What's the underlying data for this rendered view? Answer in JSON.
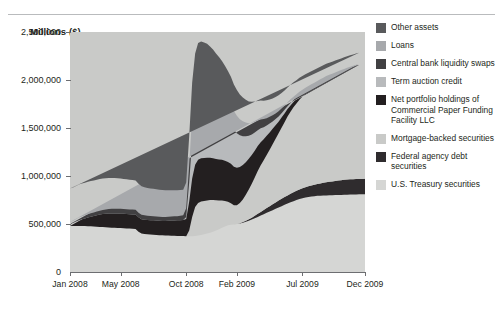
{
  "axis_title": "Millions ($)",
  "legend": {
    "items": [
      {
        "label": "Other assets",
        "color": "#595a5c"
      },
      {
        "label": "Loans",
        "color": "#a7a9ac"
      },
      {
        "label": "Central bank liquidity swaps",
        "color": "#414042"
      },
      {
        "label": "Term auction credit",
        "color": "#b8babc"
      },
      {
        "label": "Net portfolio holdings of Commercial Paper Funding Facility LLC",
        "color": "#231f20"
      },
      {
        "label": "Mortgage-backed securities",
        "color": "#c9cac8"
      },
      {
        "label": "Federal agency debt securities",
        "color": "#2f2c2e"
      },
      {
        "label": "U.S. Treasury securities",
        "color": "#d5d6d4"
      }
    ]
  },
  "chart_data": {
    "type": "area",
    "title": "",
    "xlabel": "",
    "ylabel": "Millions ($)",
    "ylim": [
      0,
      2500000
    ],
    "ytick_labels": [
      "0",
      "500,000",
      "1,000,000",
      "1,500,000",
      "2,000,000",
      "2,500,000"
    ],
    "ytick_values": [
      0,
      500000,
      1000000,
      1500000,
      2000000,
      2500000
    ],
    "grid": false,
    "legend_position": "right",
    "stacked": true,
    "xtick_labels": [
      "Jan 2008",
      "May 2008",
      "Oct 2008",
      "Feb 2009",
      "Jul 2009",
      "Dec 2009"
    ],
    "xtick_index": [
      0,
      17,
      39,
      56,
      78,
      99
    ],
    "x_count": 100,
    "series": [
      {
        "name": "U.S. Treasury securities",
        "color": "#d5d6d4",
        "values": [
          480000,
          480000,
          480000,
          480000,
          479000,
          478000,
          477000,
          476000,
          474000,
          472000,
          470000,
          468000,
          466000,
          464000,
          462000,
          460000,
          459000,
          458000,
          456000,
          454000,
          452000,
          450000,
          448000,
          420000,
          400000,
          395000,
          392000,
          390000,
          388000,
          386000,
          384000,
          382000,
          380000,
          379000,
          378000,
          377000,
          376000,
          375000,
          374000,
          373000,
          372000,
          373000,
          376000,
          380000,
          385000,
          392000,
          400000,
          410000,
          420000,
          432000,
          445000,
          460000,
          474000,
          486000,
          492000,
          496000,
          500000,
          506000,
          514000,
          524000,
          534000,
          546000,
          560000,
          574000,
          588000,
          602000,
          616000,
          630000,
          644000,
          658000,
          672000,
          686000,
          700000,
          714000,
          726000,
          738000,
          750000,
          760000,
          768000,
          775000,
          781000,
          786000,
          790000,
          793000,
          795000,
          797000,
          798000,
          799000,
          800000,
          801000,
          802000,
          803000,
          804000,
          805000,
          806000,
          807000,
          808000,
          809000,
          810000,
          811000
        ]
      },
      {
        "name": "Federal agency debt securities",
        "color": "#2f2c2e",
        "values": [
          0,
          0,
          0,
          0,
          0,
          0,
          0,
          0,
          0,
          0,
          0,
          0,
          0,
          0,
          0,
          0,
          0,
          0,
          0,
          0,
          0,
          0,
          0,
          0,
          0,
          0,
          0,
          0,
          0,
          0,
          0,
          0,
          0,
          0,
          0,
          0,
          0,
          0,
          0,
          0,
          0,
          0,
          0,
          0,
          0,
          0,
          0,
          0,
          0,
          0,
          0,
          0,
          0,
          0,
          0,
          0,
          1000,
          3000,
          6000,
          10000,
          15000,
          20000,
          26000,
          32000,
          38000,
          44000,
          50000,
          56000,
          62000,
          67000,
          72000,
          76000,
          80000,
          84000,
          88000,
          92000,
          96000,
          100000,
          104000,
          108000,
          112000,
          116000,
          120000,
          124000,
          128000,
          132000,
          136000,
          140000,
          144000,
          148000,
          151000,
          154000,
          157000,
          159000,
          160000,
          160000,
          160000,
          160000,
          160000,
          160000
        ]
      },
      {
        "name": "Mortgage-backed securities",
        "color": "#c9cac8",
        "values": [
          0,
          0,
          0,
          0,
          0,
          0,
          0,
          0,
          0,
          0,
          0,
          0,
          0,
          0,
          0,
          0,
          0,
          0,
          0,
          0,
          0,
          0,
          0,
          0,
          0,
          0,
          0,
          0,
          0,
          0,
          0,
          0,
          0,
          0,
          0,
          0,
          0,
          0,
          0,
          0,
          0,
          0,
          0,
          0,
          0,
          0,
          0,
          0,
          0,
          0,
          0,
          0,
          0,
          0,
          0,
          0,
          20000,
          60000,
          110000,
          170000,
          230000,
          290000,
          350000,
          410000,
          460000,
          500000,
          540000,
          580000,
          620000,
          660000,
          700000,
          740000,
          780000,
          820000,
          855000,
          885000,
          910000,
          935000,
          955000,
          975000,
          990000,
          1005000,
          1020000,
          1035000,
          1050000,
          1065000,
          1080000,
          1090000,
          1100000,
          1110000,
          1120000,
          1130000,
          1140000,
          1150000,
          1160000,
          1170000,
          1180000,
          1190000,
          1200000,
          1205000
        ]
      },
      {
        "name": "Net portfolio holdings of Commercial Paper Funding Facility LLC",
        "color": "#231f20",
        "values": [
          0,
          0,
          0,
          0,
          0,
          0,
          0,
          0,
          0,
          0,
          0,
          0,
          0,
          0,
          0,
          0,
          0,
          0,
          0,
          0,
          0,
          0,
          0,
          0,
          0,
          0,
          0,
          0,
          0,
          0,
          0,
          0,
          0,
          0,
          0,
          0,
          0,
          0,
          0,
          0,
          60000,
          200000,
          300000,
          340000,
          350000,
          348000,
          345000,
          340000,
          330000,
          315000,
          300000,
          285000,
          265000,
          245000,
          225000,
          200000,
          175000,
          150000,
          125000,
          100000,
          80000,
          62000,
          48000,
          36000,
          26000,
          18000,
          12000,
          8000,
          5000,
          3000,
          2000,
          1500,
          1000,
          800,
          600,
          500,
          400,
          300,
          250,
          200,
          160,
          130,
          100,
          80,
          60,
          50,
          40,
          30,
          25,
          20,
          15,
          12,
          10,
          8,
          6,
          5,
          4,
          3
        ]
      },
      {
        "name": "Term auction credit",
        "color": "#b8babc",
        "values": [
          20000,
          30000,
          45000,
          60000,
          70000,
          80000,
          90000,
          100000,
          110000,
          120000,
          128000,
          135000,
          140000,
          145000,
          148000,
          150000,
          150000,
          150000,
          150000,
          150000,
          150000,
          150000,
          150000,
          150000,
          150000,
          150000,
          150000,
          150000,
          150000,
          150000,
          150000,
          150000,
          152000,
          155000,
          158000,
          160000,
          162000,
          165000,
          168000,
          180000,
          300000,
          400000,
          440000,
          450000,
          450000,
          448000,
          445000,
          440000,
          435000,
          430000,
          428000,
          425000,
          420000,
          415000,
          410000,
          400000,
          390000,
          375000,
          360000,
          340000,
          320000,
          300000,
          280000,
          260000,
          240000,
          220000,
          200000,
          180000,
          160000,
          140000,
          120000,
          105000,
          90000,
          78000,
          66000,
          56000,
          48000,
          40000,
          34000,
          28000,
          24000,
          20000,
          17000,
          14000,
          12000,
          10000,
          8000,
          7000,
          6000,
          5000,
          4000,
          3500,
          3000,
          2500,
          2000,
          1600,
          1200,
          900,
          600,
          300
        ]
      },
      {
        "name": "Central bank liquidity swaps",
        "color": "#414042",
        "values": [
          0,
          0,
          0,
          0,
          0,
          0,
          0,
          0,
          0,
          0,
          0,
          0,
          0,
          0,
          0,
          0,
          0,
          0,
          0,
          0,
          0,
          0,
          0,
          0,
          0,
          0,
          0,
          0,
          0,
          0,
          0,
          0,
          0,
          0,
          0,
          0,
          0,
          0,
          0,
          20000,
          200000,
          400000,
          500000,
          540000,
          550000,
          545000,
          540000,
          530000,
          520000,
          505000,
          490000,
          470000,
          450000,
          430000,
          410000,
          385000,
          360000,
          330000,
          300000,
          270000,
          240000,
          215000,
          190000,
          165000,
          145000,
          125000,
          108000,
          92000,
          78000,
          66000,
          55000,
          46000,
          38000,
          31000,
          26000,
          21000,
          17000,
          14000,
          11000,
          9000,
          7000,
          5500,
          4500,
          3500,
          3000,
          2500,
          2000,
          1600,
          1300,
          1000,
          800,
          650,
          500,
          400,
          300,
          250,
          200,
          150,
          100
        ]
      },
      {
        "name": "Loans",
        "color": "#a7a9ac",
        "values": [
          20000,
          22000,
          25000,
          28000,
          30000,
          32000,
          34000,
          35000,
          36000,
          38000,
          40000,
          42000,
          44000,
          46000,
          48000,
          50000,
          50000,
          50000,
          50000,
          50000,
          50000,
          50000,
          50000,
          48000,
          46000,
          45000,
          44000,
          43000,
          42000,
          42000,
          42000,
          42000,
          42000,
          42000,
          42000,
          43000,
          44000,
          45000,
          48000,
          90000,
          180000,
          260000,
          300000,
          310000,
          305000,
          300000,
          295000,
          285000,
          275000,
          265000,
          255000,
          245000,
          235000,
          222000,
          210000,
          195000,
          182000,
          168000,
          155000,
          142000,
          130000,
          120000,
          110000,
          100000,
          92000,
          84000,
          76000,
          70000,
          64000,
          58000,
          53000,
          48000,
          44000,
          40000,
          37000,
          34000,
          31000,
          29000,
          27000,
          25000,
          23000,
          22000,
          21000,
          20000,
          19000,
          18000,
          17000,
          16000,
          15000,
          14000,
          13000,
          12000,
          11000,
          10000,
          9500,
          9000,
          8500,
          8000,
          7500,
          7000
        ]
      },
      {
        "name": "Other assets",
        "color": "#595a5c",
        "values": [
          350000,
          348000,
          346000,
          344000,
          342000,
          340000,
          338000,
          336000,
          334000,
          332000,
          330000,
          328000,
          326000,
          324000,
          322000,
          320000,
          318000,
          316000,
          314000,
          312000,
          310000,
          308000,
          306000,
          300000,
          296000,
          292000,
          290000,
          288000,
          286000,
          284000,
          282000,
          280000,
          278000,
          276000,
          274000,
          272000,
          270000,
          268000,
          266000,
          270000,
          300000,
          340000,
          360000,
          365000,
          362000,
          358000,
          352000,
          345000,
          338000,
          330000,
          322000,
          314000,
          305000,
          296000,
          288000,
          278000,
          268000,
          258000,
          248000,
          238000,
          228000,
          220000,
          212000,
          205000,
          198000,
          192000,
          186000,
          180000,
          175000,
          170000,
          166000,
          162000,
          158000,
          155000,
          152000,
          149000,
          146000,
          144000,
          142000,
          140000,
          138000,
          136000,
          134000,
          132000,
          130000,
          128000,
          127000,
          126000,
          125000,
          124000,
          123000,
          122000,
          121000,
          120000,
          119000,
          118000,
          117000,
          116000,
          115000,
          114000
        ]
      }
    ]
  }
}
